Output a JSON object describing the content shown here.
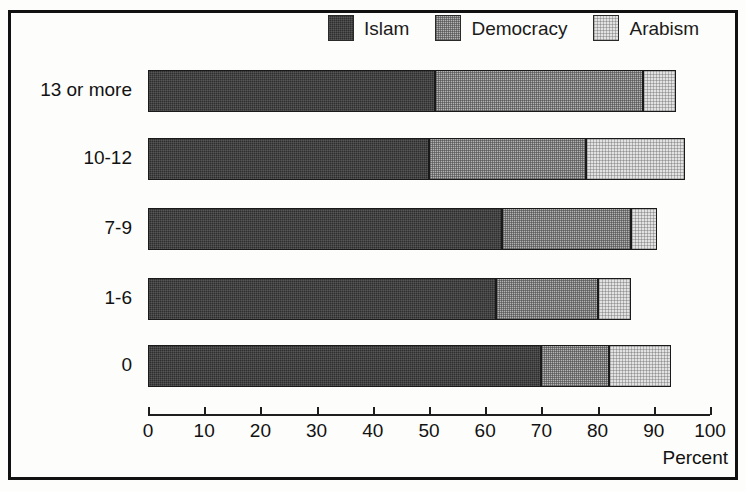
{
  "chart_data": {
    "type": "bar",
    "orientation": "horizontal",
    "stacked": true,
    "title": "",
    "subtitle": "",
    "xlabel": "Percent",
    "ylabel": "",
    "xlim": [
      0,
      100
    ],
    "xticks": [
      0,
      10,
      20,
      30,
      40,
      50,
      60,
      70,
      80,
      90,
      100
    ],
    "grid": false,
    "legend_position": "top-right",
    "categories": [
      "13 or more",
      "10-12",
      "7-9",
      "1-6",
      "0"
    ],
    "series": [
      {
        "name": "Islam",
        "color": "#2e2e2e",
        "values": [
          51,
          50,
          63,
          62,
          70
        ]
      },
      {
        "name": "Democracy",
        "color": "#b3b3b3",
        "values": [
          37,
          28,
          23,
          18,
          12
        ]
      },
      {
        "name": "Arabism",
        "color": "#e2e2e2",
        "values": [
          6,
          17.5,
          4.5,
          6,
          11
        ]
      }
    ],
    "totals": [
      94,
      95.5,
      90.5,
      86,
      93
    ]
  },
  "legend": {
    "items": [
      {
        "label": "Islam",
        "swatch": "dark-hatch-swatch"
      },
      {
        "label": "Democracy",
        "swatch": "medium-hatch-swatch"
      },
      {
        "label": "Arabism",
        "swatch": "light-hatch-swatch"
      }
    ]
  },
  "axis": {
    "title": "Percent",
    "ticks": [
      "0",
      "10",
      "20",
      "30",
      "40",
      "50",
      "60",
      "70",
      "80",
      "90",
      "100"
    ]
  },
  "categories": [
    "13 or more",
    "10-12",
    "7-9",
    "1-6",
    "0"
  ]
}
